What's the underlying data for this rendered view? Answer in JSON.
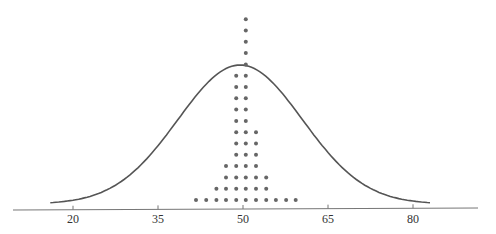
{
  "chart_data": {
    "type": "scatter",
    "subtype": "dot-plot-with-normal-curve",
    "title": "",
    "xlabel": "",
    "ylabel": "",
    "xlim": [
      9,
      90
    ],
    "x_ticks": [
      20,
      35,
      50,
      65,
      80
    ],
    "grid": false,
    "legend": null,
    "dot_columns": [
      {
        "x": 41.7,
        "count": 1
      },
      {
        "x": 43.5,
        "count": 1
      },
      {
        "x": 45.3,
        "count": 2
      },
      {
        "x": 47.0,
        "count": 4
      },
      {
        "x": 48.8,
        "count": 12
      },
      {
        "x": 50.5,
        "count": 17
      },
      {
        "x": 52.3,
        "count": 7
      },
      {
        "x": 54.1,
        "count": 3
      },
      {
        "x": 55.8,
        "count": 1
      },
      {
        "x": 57.6,
        "count": 1
      },
      {
        "x": 59.3,
        "count": 1
      }
    ],
    "normal_curve": {
      "mean": 49.5,
      "sd": 11,
      "x_range": [
        16,
        83
      ]
    },
    "colors": {
      "dots": "#666666",
      "curve": "#555555",
      "axis": "#777777"
    }
  }
}
